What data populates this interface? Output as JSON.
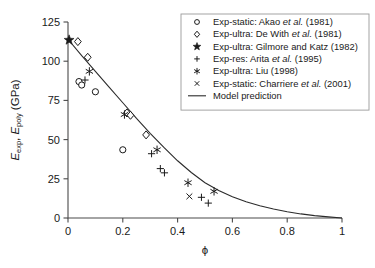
{
  "chart_data": {
    "type": "scatter",
    "title": "",
    "xlabel": "ϕ",
    "ylabel": "E_exp, E_poly (GPa)",
    "ylabel_parts": {
      "e1": "E",
      "e1_sub": "exp",
      "sep": ", ",
      "e2": "E",
      "e2_sub": "poly",
      "units": " (GPa)"
    },
    "xlim": [
      0,
      1
    ],
    "ylim": [
      0,
      125
    ],
    "xticks": [
      0,
      0.2,
      0.4,
      0.6,
      0.8,
      1
    ],
    "xtick_labels": [
      "0",
      "0.2",
      "0.4",
      "0.6",
      "0.8",
      "1"
    ],
    "yticks": [
      0,
      25,
      50,
      75,
      100,
      125
    ],
    "ytick_labels": [
      "0",
      "25",
      "50",
      "75",
      "100",
      "125"
    ],
    "grid": false,
    "legend_position": "top-right",
    "series": [
      {
        "name": "Exp-static: Akao et al. (1981)",
        "marker": "circle-open",
        "points": [
          [
            0.04,
            87.0
          ],
          [
            0.05,
            84.8
          ],
          [
            0.1,
            80.5
          ],
          [
            0.2,
            43.5
          ]
        ]
      },
      {
        "name": "Exp-ultra: De With et al. (1981)",
        "marker": "diamond-open",
        "points": [
          [
            0.036,
            112.5
          ],
          [
            0.072,
            102.5
          ],
          [
            0.215,
            67.0
          ],
          [
            0.228,
            65.5
          ],
          [
            0.285,
            53.0
          ]
        ]
      },
      {
        "name": "Exp-ultra: Gilmore and Katz (1982)",
        "marker": "star-solid",
        "points": [
          [
            0.004,
            113.5
          ]
        ]
      },
      {
        "name": "Exp-res: Arita et al. (1995)",
        "marker": "plus",
        "points": [
          [
            0.062,
            88.0
          ],
          [
            0.305,
            41.0
          ],
          [
            0.337,
            31.5
          ],
          [
            0.352,
            28.8
          ],
          [
            0.487,
            13.2
          ],
          [
            0.512,
            9.5
          ]
        ]
      },
      {
        "name": "Exp-ultra: Liu (1998)",
        "marker": "asterisk",
        "points": [
          [
            0.078,
            93.5
          ],
          [
            0.206,
            66.0
          ],
          [
            0.325,
            43.5
          ],
          [
            0.438,
            22.5
          ],
          [
            0.533,
            17.0
          ]
        ]
      },
      {
        "name": "Exp-static: Charriere et al. (2001)",
        "marker": "cross",
        "points": [
          [
            0.443,
            13.8
          ]
        ]
      },
      {
        "name": "Model prediction",
        "marker": "line",
        "points": [
          [
            0.0,
            114.0
          ],
          [
            0.05,
            103.5
          ],
          [
            0.1,
            93.5
          ],
          [
            0.15,
            83.5
          ],
          [
            0.2,
            73.5
          ],
          [
            0.25,
            63.5
          ],
          [
            0.3,
            54.0
          ],
          [
            0.35,
            45.0
          ],
          [
            0.4,
            36.5
          ],
          [
            0.45,
            29.0
          ],
          [
            0.5,
            22.5
          ],
          [
            0.55,
            17.5
          ],
          [
            0.6,
            13.5
          ],
          [
            0.65,
            10.3
          ],
          [
            0.7,
            7.8
          ],
          [
            0.75,
            5.7
          ],
          [
            0.8,
            4.0
          ],
          [
            0.85,
            2.6
          ],
          [
            0.9,
            1.5
          ],
          [
            0.95,
            0.7
          ],
          [
            1.0,
            0.0
          ]
        ]
      }
    ],
    "legend_entries": [
      {
        "marker": "circle-open",
        "label": "Exp-static: Akao ",
        "italic": "et al.",
        "tail": " (1981)"
      },
      {
        "marker": "diamond-open",
        "label": "Exp-ultra: De With ",
        "italic": "et al.",
        "tail": " (1981)"
      },
      {
        "marker": "star-solid",
        "label": "Exp-ultra: Gilmore and Katz (1982)",
        "italic": "",
        "tail": ""
      },
      {
        "marker": "plus",
        "label": "Exp-res: Arita ",
        "italic": "et al.",
        "tail": " (1995)"
      },
      {
        "marker": "asterisk",
        "label": "Exp-ultra: Liu (1998)",
        "italic": "",
        "tail": ""
      },
      {
        "marker": "cross",
        "label": "Exp-static: Charriere ",
        "italic": "et al.",
        "tail": " (2001)"
      },
      {
        "marker": "line",
        "label": "Model prediction",
        "italic": "",
        "tail": ""
      }
    ],
    "colors": {
      "axis": "#4a4a4a",
      "curve": "#2b2b2b",
      "marker": "#1a1a1a",
      "legend_border": "#9a9a9a",
      "background": "#ffffff"
    }
  }
}
